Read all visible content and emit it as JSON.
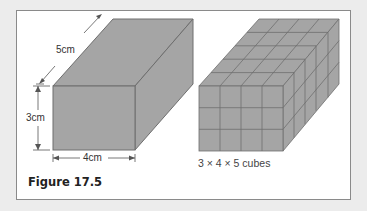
{
  "figure": {
    "title": "Figure 17.5",
    "left_box": {
      "labels": {
        "depth": "5cm",
        "height": "3cm",
        "width": "4cm"
      },
      "dimensions_cm": {
        "width": 4,
        "height": 3,
        "depth": 5
      }
    },
    "right_box": {
      "caption": "3 × 4 × 5 cubes",
      "grid": {
        "rows": 3,
        "cols": 4,
        "depth": 5
      }
    },
    "colors": {
      "face": "#a5a5a5",
      "edge": "#6e6e6e",
      "background": "#ffffff",
      "frame_border": "#8a8a8a"
    }
  }
}
